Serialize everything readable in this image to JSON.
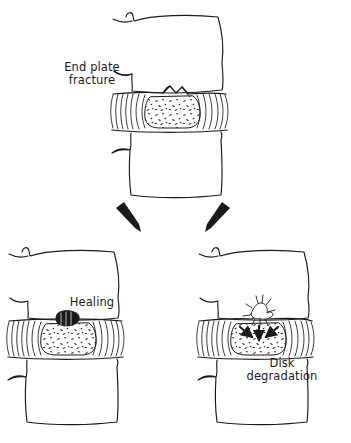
{
  "figure": {
    "background_color": "#ffffff",
    "ink_color": "#1a1a1a",
    "width": 351,
    "height": 443
  },
  "labels": {
    "endplate_fracture": "End plate\nfracture",
    "healing": "Healing",
    "disk_degradation": "Disk\ndegradation"
  },
  "panels": [
    {
      "id": "top",
      "name": "end-plate-fracture-panel",
      "label": "End plate\nfracture",
      "description": "Motion segment with two vertebral bodies and an intervertebral disk showing a fractured superior end plate",
      "feature": "endplate-fracture-notch"
    },
    {
      "id": "bottom-left",
      "name": "healing-panel",
      "label": "Healing",
      "description": "Motion segment in which the end plate fracture has consolidated into a bony callus",
      "feature": "healing-callus"
    },
    {
      "id": "bottom-right",
      "name": "disk-degradation-panel",
      "label": "Disk\ndegradation",
      "description": "Motion segment in which the end plate defect allows nucleus material to extrude and the disk degenerates",
      "feature": "degradation-starburst"
    }
  ],
  "flow_arrows": [
    {
      "name": "arrow-to-healing",
      "from": "top",
      "to": "bottom-left",
      "direction": "down-left"
    },
    {
      "name": "arrow-to-degradation",
      "from": "top",
      "to": "bottom-right",
      "direction": "down-right"
    }
  ],
  "degradation_arrows": {
    "count": 3,
    "direction": "inward-downward",
    "meaning": "nucleus pulposus pressure directed into the end plate defect"
  },
  "anatomy": {
    "vertebral_body": "vertebral-body",
    "annulus_fibrosus": "annulus-fibrosus-lamellae",
    "nucleus_pulposus": "nucleus-pulposus-stipple",
    "end_plate": "vertebral-end-plate"
  }
}
